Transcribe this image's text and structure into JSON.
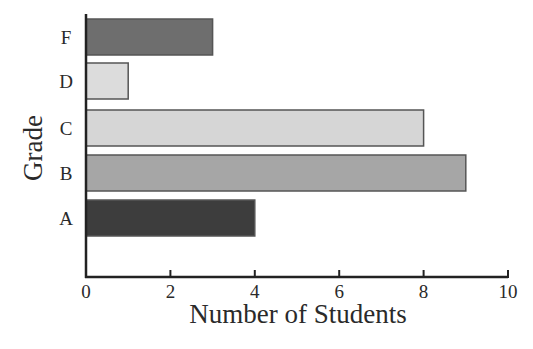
{
  "chart_data": {
    "type": "bar",
    "orientation": "horizontal",
    "title": "",
    "xlabel": "Number of Students",
    "ylabel": "Grade",
    "categories": [
      "A",
      "B",
      "C",
      "D",
      "F"
    ],
    "values": [
      4,
      9,
      8,
      1,
      3
    ],
    "colors": [
      "#3d3d3d",
      "#a6a6a6",
      "#d6d6d6",
      "#dcdcdc",
      "#6e6e6e"
    ],
    "xlim": [
      0,
      10
    ],
    "xticks": [
      0,
      2,
      4,
      6,
      8,
      10
    ],
    "grid": false,
    "legend": null
  }
}
